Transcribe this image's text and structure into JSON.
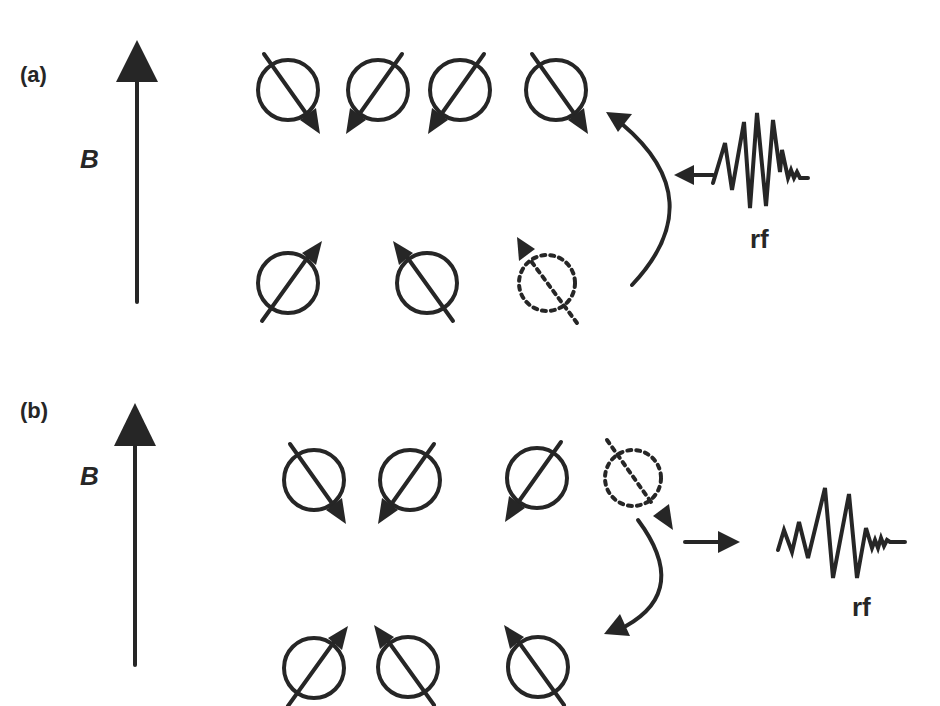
{
  "colors": {
    "ink": "#262626",
    "background": "#ffffff"
  },
  "panels": [
    {
      "label": "(a)",
      "label_pos": [
        20,
        82
      ],
      "field": {
        "label": "B",
        "label_pos": [
          80,
          168
        ],
        "x": 137,
        "y_bottom": 302,
        "y_tip": 40
      },
      "spins": [
        {
          "cx": 288,
          "cy": 90,
          "dir": "down-right",
          "state": "excited"
        },
        {
          "cx": 378,
          "cy": 90,
          "dir": "down-left",
          "state": "excited"
        },
        {
          "cx": 460,
          "cy": 90,
          "dir": "down-left",
          "state": "excited"
        },
        {
          "cx": 556,
          "cy": 90,
          "dir": "down-right",
          "state": "excited"
        },
        {
          "cx": 288,
          "cy": 283,
          "dir": "up-right",
          "state": "ground"
        },
        {
          "cx": 427,
          "cy": 283,
          "dir": "up-left",
          "state": "ground"
        },
        {
          "cx": 547,
          "cy": 283,
          "dir": "up-left",
          "state": "ground-vacated"
        }
      ],
      "transition_arrow": {
        "description": "absorption: curved arrow from lower level to upper level",
        "path": "M 632 285 Q 700 200 610 118"
      },
      "rf": {
        "label": "rf",
        "label_pos": [
          760,
          248
        ],
        "direction": "incoming"
      }
    },
    {
      "label": "(b)",
      "label_pos": [
        20,
        418
      ],
      "field": {
        "label": "B",
        "label_pos": [
          80,
          485
        ],
        "x": 135,
        "y_bottom": 665,
        "y_tip": 405
      },
      "spins": [
        {
          "cx": 314,
          "cy": 480,
          "dir": "down-right",
          "state": "excited"
        },
        {
          "cx": 410,
          "cy": 480,
          "dir": "down-left",
          "state": "excited"
        },
        {
          "cx": 537,
          "cy": 478,
          "dir": "down-left",
          "state": "excited"
        },
        {
          "cx": 633,
          "cy": 478,
          "dir": "down-right",
          "state": "excited-vacated"
        },
        {
          "cx": 314,
          "cy": 668,
          "dir": "up-right",
          "state": "ground"
        },
        {
          "cx": 408,
          "cy": 667,
          "dir": "up-left",
          "state": "ground"
        },
        {
          "cx": 538,
          "cy": 667,
          "dir": "up-left",
          "state": "ground"
        }
      ],
      "transition_arrow": {
        "description": "emission: curved arrow from upper level to lower level",
        "path": "M 640 520 Q 690 600 612 630"
      },
      "rf": {
        "label": "rf",
        "label_pos": [
          865,
          616
        ],
        "direction": "outgoing"
      }
    }
  ]
}
